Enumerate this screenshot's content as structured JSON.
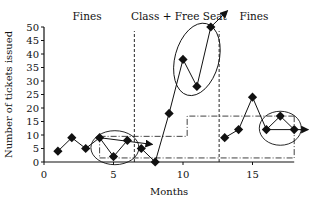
{
  "chart_data": {
    "type": "line",
    "title": "",
    "xlabel": "Months",
    "ylabel": "Number of tickets issued",
    "xlim": [
      0,
      18
    ],
    "ylim": [
      0,
      50
    ],
    "x_ticks": [
      0,
      5,
      10,
      15
    ],
    "y_ticks": [
      0,
      5,
      10,
      15,
      20,
      25,
      30,
      35,
      40,
      45,
      50
    ],
    "grid": false,
    "legend": null,
    "series": [
      {
        "name": "Tickets issued",
        "marker": "diamond",
        "x": [
          1,
          2,
          3,
          4,
          5,
          6,
          7,
          8,
          9,
          10,
          11,
          12,
          13,
          14,
          15,
          16,
          17,
          18
        ],
        "values": [
          4,
          9,
          5,
          9,
          2,
          8,
          5,
          0,
          18,
          38,
          28,
          50,
          9,
          12,
          24,
          12,
          17,
          12
        ]
      }
    ],
    "annotations": [
      {
        "type": "phase_label",
        "text": "Fines",
        "x_range": [
          0,
          6.5
        ]
      },
      {
        "type": "phase_label",
        "text": "Class + Free Seat",
        "x_range": [
          6.5,
          12.6
        ]
      },
      {
        "type": "phase_label",
        "text": "Fines",
        "x_range": [
          12.6,
          18
        ]
      },
      {
        "type": "phase_divider",
        "x": 6.5,
        "style": "dashed"
      },
      {
        "type": "phase_divider",
        "x": 12.6,
        "style": "dashed"
      },
      {
        "type": "circle",
        "around_months": [
          4,
          5,
          6
        ]
      },
      {
        "type": "ellipse",
        "around_months": [
          10,
          11,
          12
        ]
      },
      {
        "type": "circle",
        "around_months": [
          16,
          17,
          18
        ]
      },
      {
        "type": "trend_arrow",
        "from": [
          4,
          9
        ],
        "to": [
          7.8,
          6.5
        ]
      },
      {
        "type": "trend_arrow",
        "from": [
          12,
          50
        ],
        "to": [
          13.2,
          56
        ]
      },
      {
        "type": "trend_arrow",
        "from": [
          16,
          12
        ],
        "to": [
          19,
          12
        ]
      },
      {
        "type": "band_upper",
        "style": "dash-dot",
        "points": [
          [
            4,
            9.5
          ],
          [
            10.3,
            9.5
          ],
          [
            10.3,
            17
          ],
          [
            18,
            17
          ]
        ]
      },
      {
        "type": "band_lower",
        "style": "dash-dot",
        "points": [
          [
            4,
            1.5
          ],
          [
            18,
            1.5
          ]
        ]
      }
    ]
  }
}
